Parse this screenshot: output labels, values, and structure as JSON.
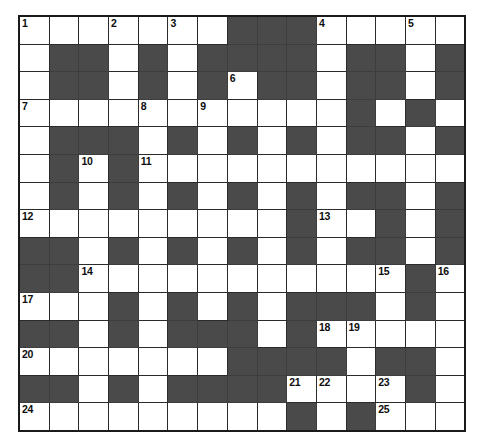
{
  "puzzle": {
    "type": "crossword-grid",
    "rows": 14,
    "columns": 15,
    "colors": {
      "block_fill": "#4a4a4a",
      "cell_fill": "#ffffff",
      "grid_line": "#2b2b2b",
      "border": "#1a1a1a",
      "number_color": "#0d0d0d"
    },
    "clue_numbers": [
      1,
      2,
      3,
      4,
      5,
      6,
      7,
      8,
      9,
      10,
      11,
      12,
      13,
      14,
      15,
      16,
      17,
      18,
      19,
      20,
      21,
      22,
      23,
      24,
      25
    ],
    "grid": [
      [
        {
          "block": false,
          "number": "1"
        },
        {
          "block": false,
          "number": ""
        },
        {
          "block": false,
          "number": ""
        },
        {
          "block": false,
          "number": "2"
        },
        {
          "block": false,
          "number": ""
        },
        {
          "block": false,
          "number": "3"
        },
        {
          "block": false,
          "number": ""
        },
        {
          "block": true,
          "number": ""
        },
        {
          "block": true,
          "number": ""
        },
        {
          "block": true,
          "number": ""
        },
        {
          "block": false,
          "number": "4"
        },
        {
          "block": false,
          "number": ""
        },
        {
          "block": false,
          "number": ""
        },
        {
          "block": false,
          "number": "5"
        },
        {
          "block": false,
          "number": ""
        }
      ],
      [
        {
          "block": false,
          "number": ""
        },
        {
          "block": true,
          "number": ""
        },
        {
          "block": true,
          "number": ""
        },
        {
          "block": false,
          "number": ""
        },
        {
          "block": true,
          "number": ""
        },
        {
          "block": false,
          "number": ""
        },
        {
          "block": true,
          "number": ""
        },
        {
          "block": true,
          "number": ""
        },
        {
          "block": true,
          "number": ""
        },
        {
          "block": true,
          "number": ""
        },
        {
          "block": false,
          "number": ""
        },
        {
          "block": true,
          "number": ""
        },
        {
          "block": true,
          "number": ""
        },
        {
          "block": false,
          "number": ""
        },
        {
          "block": true,
          "number": ""
        }
      ],
      [
        {
          "block": false,
          "number": ""
        },
        {
          "block": true,
          "number": ""
        },
        {
          "block": true,
          "number": ""
        },
        {
          "block": false,
          "number": ""
        },
        {
          "block": true,
          "number": ""
        },
        {
          "block": false,
          "number": ""
        },
        {
          "block": true,
          "number": ""
        },
        {
          "block": false,
          "number": "6"
        },
        {
          "block": true,
          "number": ""
        },
        {
          "block": true,
          "number": ""
        },
        {
          "block": false,
          "number": ""
        },
        {
          "block": true,
          "number": ""
        },
        {
          "block": true,
          "number": ""
        },
        {
          "block": false,
          "number": ""
        },
        {
          "block": true,
          "number": ""
        }
      ],
      [
        {
          "block": false,
          "number": "7"
        },
        {
          "block": false,
          "number": ""
        },
        {
          "block": false,
          "number": ""
        },
        {
          "block": false,
          "number": ""
        },
        {
          "block": false,
          "number": "8"
        },
        {
          "block": false,
          "number": ""
        },
        {
          "block": false,
          "number": "9"
        },
        {
          "block": false,
          "number": ""
        },
        {
          "block": false,
          "number": ""
        },
        {
          "block": false,
          "number": ""
        },
        {
          "block": false,
          "number": ""
        },
        {
          "block": true,
          "number": ""
        },
        {
          "block": false,
          "number": ""
        },
        {
          "block": true,
          "number": ""
        },
        {
          "block": false,
          "number": ""
        }
      ],
      [
        {
          "block": false,
          "number": ""
        },
        {
          "block": true,
          "number": ""
        },
        {
          "block": true,
          "number": ""
        },
        {
          "block": true,
          "number": ""
        },
        {
          "block": false,
          "number": ""
        },
        {
          "block": true,
          "number": ""
        },
        {
          "block": false,
          "number": ""
        },
        {
          "block": true,
          "number": ""
        },
        {
          "block": false,
          "number": ""
        },
        {
          "block": true,
          "number": ""
        },
        {
          "block": false,
          "number": ""
        },
        {
          "block": true,
          "number": ""
        },
        {
          "block": true,
          "number": ""
        },
        {
          "block": false,
          "number": ""
        },
        {
          "block": true,
          "number": ""
        }
      ],
      [
        {
          "block": false,
          "number": ""
        },
        {
          "block": true,
          "number": ""
        },
        {
          "block": false,
          "number": "10"
        },
        {
          "block": true,
          "number": ""
        },
        {
          "block": false,
          "number": "11"
        },
        {
          "block": false,
          "number": ""
        },
        {
          "block": false,
          "number": ""
        },
        {
          "block": false,
          "number": ""
        },
        {
          "block": false,
          "number": ""
        },
        {
          "block": false,
          "number": ""
        },
        {
          "block": false,
          "number": ""
        },
        {
          "block": false,
          "number": ""
        },
        {
          "block": false,
          "number": ""
        },
        {
          "block": false,
          "number": ""
        },
        {
          "block": false,
          "number": ""
        }
      ],
      [
        {
          "block": false,
          "number": ""
        },
        {
          "block": true,
          "number": ""
        },
        {
          "block": false,
          "number": ""
        },
        {
          "block": true,
          "number": ""
        },
        {
          "block": false,
          "number": ""
        },
        {
          "block": true,
          "number": ""
        },
        {
          "block": false,
          "number": ""
        },
        {
          "block": true,
          "number": ""
        },
        {
          "block": false,
          "number": ""
        },
        {
          "block": true,
          "number": ""
        },
        {
          "block": false,
          "number": ""
        },
        {
          "block": true,
          "number": ""
        },
        {
          "block": true,
          "number": ""
        },
        {
          "block": false,
          "number": ""
        },
        {
          "block": true,
          "number": ""
        }
      ],
      [
        {
          "block": false,
          "number": "12"
        },
        {
          "block": false,
          "number": ""
        },
        {
          "block": false,
          "number": ""
        },
        {
          "block": false,
          "number": ""
        },
        {
          "block": false,
          "number": ""
        },
        {
          "block": false,
          "number": ""
        },
        {
          "block": false,
          "number": ""
        },
        {
          "block": false,
          "number": ""
        },
        {
          "block": false,
          "number": ""
        },
        {
          "block": true,
          "number": ""
        },
        {
          "block": false,
          "number": "13"
        },
        {
          "block": false,
          "number": ""
        },
        {
          "block": true,
          "number": ""
        },
        {
          "block": false,
          "number": ""
        },
        {
          "block": true,
          "number": ""
        }
      ],
      [
        {
          "block": true,
          "number": ""
        },
        {
          "block": true,
          "number": ""
        },
        {
          "block": false,
          "number": ""
        },
        {
          "block": true,
          "number": ""
        },
        {
          "block": false,
          "number": ""
        },
        {
          "block": true,
          "number": ""
        },
        {
          "block": false,
          "number": ""
        },
        {
          "block": true,
          "number": ""
        },
        {
          "block": false,
          "number": ""
        },
        {
          "block": true,
          "number": ""
        },
        {
          "block": false,
          "number": ""
        },
        {
          "block": true,
          "number": ""
        },
        {
          "block": true,
          "number": ""
        },
        {
          "block": false,
          "number": ""
        },
        {
          "block": true,
          "number": ""
        }
      ],
      [
        {
          "block": true,
          "number": ""
        },
        {
          "block": true,
          "number": ""
        },
        {
          "block": false,
          "number": "14"
        },
        {
          "block": false,
          "number": ""
        },
        {
          "block": false,
          "number": ""
        },
        {
          "block": false,
          "number": ""
        },
        {
          "block": false,
          "number": ""
        },
        {
          "block": false,
          "number": ""
        },
        {
          "block": false,
          "number": ""
        },
        {
          "block": false,
          "number": ""
        },
        {
          "block": false,
          "number": ""
        },
        {
          "block": false,
          "number": ""
        },
        {
          "block": false,
          "number": "15"
        },
        {
          "block": true,
          "number": ""
        },
        {
          "block": false,
          "number": "16"
        }
      ],
      [
        {
          "block": false,
          "number": "17"
        },
        {
          "block": false,
          "number": ""
        },
        {
          "block": false,
          "number": ""
        },
        {
          "block": true,
          "number": ""
        },
        {
          "block": false,
          "number": ""
        },
        {
          "block": true,
          "number": ""
        },
        {
          "block": false,
          "number": ""
        },
        {
          "block": true,
          "number": ""
        },
        {
          "block": false,
          "number": ""
        },
        {
          "block": true,
          "number": ""
        },
        {
          "block": true,
          "number": ""
        },
        {
          "block": true,
          "number": ""
        },
        {
          "block": false,
          "number": ""
        },
        {
          "block": true,
          "number": ""
        },
        {
          "block": false,
          "number": ""
        }
      ],
      [
        {
          "block": true,
          "number": ""
        },
        {
          "block": true,
          "number": ""
        },
        {
          "block": false,
          "number": ""
        },
        {
          "block": true,
          "number": ""
        },
        {
          "block": false,
          "number": ""
        },
        {
          "block": true,
          "number": ""
        },
        {
          "block": true,
          "number": ""
        },
        {
          "block": true,
          "number": ""
        },
        {
          "block": false,
          "number": ""
        },
        {
          "block": true,
          "number": ""
        },
        {
          "block": false,
          "number": "18"
        },
        {
          "block": false,
          "number": "19"
        },
        {
          "block": false,
          "number": ""
        },
        {
          "block": false,
          "number": ""
        },
        {
          "block": false,
          "number": ""
        }
      ],
      [
        {
          "block": false,
          "number": "20"
        },
        {
          "block": false,
          "number": ""
        },
        {
          "block": false,
          "number": ""
        },
        {
          "block": false,
          "number": ""
        },
        {
          "block": false,
          "number": ""
        },
        {
          "block": false,
          "number": ""
        },
        {
          "block": false,
          "number": ""
        },
        {
          "block": true,
          "number": ""
        },
        {
          "block": true,
          "number": ""
        },
        {
          "block": true,
          "number": ""
        },
        {
          "block": true,
          "number": ""
        },
        {
          "block": false,
          "number": ""
        },
        {
          "block": true,
          "number": ""
        },
        {
          "block": true,
          "number": ""
        },
        {
          "block": false,
          "number": ""
        }
      ],
      [
        {
          "block": true,
          "number": ""
        },
        {
          "block": true,
          "number": ""
        },
        {
          "block": false,
          "number": ""
        },
        {
          "block": true,
          "number": ""
        },
        {
          "block": false,
          "number": ""
        },
        {
          "block": true,
          "number": ""
        },
        {
          "block": true,
          "number": ""
        },
        {
          "block": true,
          "number": ""
        },
        {
          "block": true,
          "number": ""
        },
        {
          "block": false,
          "number": "21"
        },
        {
          "block": false,
          "number": "22"
        },
        {
          "block": false,
          "number": ""
        },
        {
          "block": false,
          "number": "23"
        },
        {
          "block": true,
          "number": ""
        },
        {
          "block": false,
          "number": ""
        }
      ],
      [
        {
          "block": false,
          "number": "24"
        },
        {
          "block": false,
          "number": ""
        },
        {
          "block": false,
          "number": ""
        },
        {
          "block": false,
          "number": ""
        },
        {
          "block": false,
          "number": ""
        },
        {
          "block": false,
          "number": ""
        },
        {
          "block": false,
          "number": ""
        },
        {
          "block": false,
          "number": ""
        },
        {
          "block": false,
          "number": ""
        },
        {
          "block": true,
          "number": ""
        },
        {
          "block": false,
          "number": ""
        },
        {
          "block": true,
          "number": ""
        },
        {
          "block": false,
          "number": "25"
        },
        {
          "block": false,
          "number": ""
        },
        {
          "block": false,
          "number": ""
        }
      ]
    ]
  }
}
